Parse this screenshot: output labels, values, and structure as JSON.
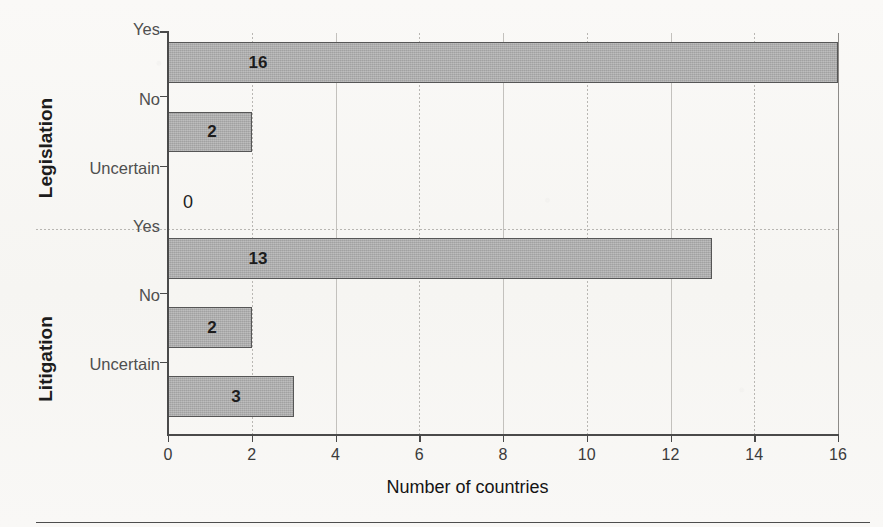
{
  "chart_data": {
    "type": "bar",
    "orientation": "horizontal",
    "title": "",
    "xlabel": "Number of countries",
    "ylabel": "",
    "xlim": [
      0,
      16
    ],
    "xticks": [
      0,
      2,
      4,
      6,
      8,
      10,
      12,
      14,
      16
    ],
    "xtick_labels": [
      "0",
      "2",
      "4",
      "6",
      "8",
      "10",
      "12",
      "14",
      "16"
    ],
    "grid": "vertical",
    "legend": "none",
    "groups": [
      {
        "name": "Legislation",
        "categories": [
          "Yes",
          "No",
          "Uncertain"
        ],
        "values": [
          16,
          2,
          0
        ],
        "value_labels": [
          "16",
          "2",
          "0"
        ]
      },
      {
        "name": "Litigation",
        "categories": [
          "Yes",
          "No",
          "Uncertain"
        ],
        "values": [
          13,
          2,
          3
        ],
        "value_labels": [
          "13",
          "2",
          "3"
        ]
      }
    ],
    "colors": {
      "bar_fill": "#a9a9a9",
      "bar_stroke": "#565656",
      "axis": "#4a4a4a",
      "gridline": "#c3c1bd",
      "background": "#f8f7f5",
      "label_text": "#4f4f4f",
      "value_text": "#1d1d1d"
    }
  },
  "bars": [
    {
      "id": "legislation-yes",
      "group": "Legislation",
      "category": "Yes",
      "value": 16,
      "label": "16",
      "top": 9,
      "height": 41,
      "has_bar": true,
      "label_offset": 90
    },
    {
      "id": "legislation-no",
      "group": "Legislation",
      "category": "No",
      "value": 2,
      "label": "2",
      "top": 79,
      "height": 40,
      "has_bar": true,
      "label_offset": 44
    },
    {
      "id": "legislation-uncertain",
      "group": "Legislation",
      "category": "Uncertain",
      "value": 0,
      "label": "0",
      "top": 148,
      "height": 41,
      "has_bar": false,
      "label_offset": 20
    },
    {
      "id": "litigation-yes",
      "group": "Litigation",
      "category": "Yes",
      "value": 13,
      "label": "13",
      "top": 205,
      "height": 41,
      "has_bar": true,
      "label_offset": 90
    },
    {
      "id": "litigation-no",
      "group": "Litigation",
      "category": "No",
      "value": 2,
      "label": "2",
      "top": 274,
      "height": 41,
      "has_bar": true,
      "label_offset": 44
    },
    {
      "id": "litigation-uncertain",
      "group": "Litigation",
      "category": "Uncertain",
      "value": 3,
      "label": "3",
      "top": 343,
      "height": 41,
      "has_bar": true,
      "label_offset": 68
    }
  ],
  "category_labels": [
    {
      "text": "Yes",
      "y": 29
    },
    {
      "text": "No",
      "y": 99
    },
    {
      "text": "Uncertain",
      "y": 168
    },
    {
      "text": "Yes",
      "y": 226
    },
    {
      "text": "No",
      "y": 295
    },
    {
      "text": "Uncertain",
      "y": 364
    }
  ],
  "group_labels": [
    {
      "text": "Legislation",
      "center_y": 115
    },
    {
      "text": "Litigation",
      "center_y": 326
    }
  ],
  "ytick_positions": [
    63,
    133,
    260,
    329
  ],
  "gridlines": [
    {
      "value": 0,
      "style": "edge"
    },
    {
      "value": 2,
      "style": "dotted"
    },
    {
      "value": 4,
      "style": "solid"
    },
    {
      "value": 6,
      "style": "dotted"
    },
    {
      "value": 8,
      "style": "solid"
    },
    {
      "value": 10,
      "style": "dotted"
    },
    {
      "value": 12,
      "style": "solid"
    },
    {
      "value": 14,
      "style": "dotted"
    },
    {
      "value": 16,
      "style": "edge"
    }
  ]
}
